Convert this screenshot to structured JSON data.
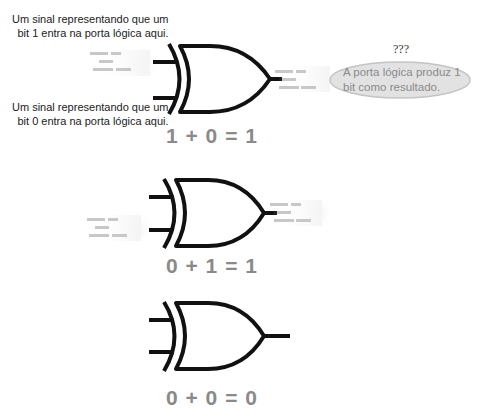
{
  "diagram": {
    "labels": {
      "input_bit1": [
        "Um sinal representando que um",
        "bit 1 entra na porta lógica aqui."
      ],
      "input_bit0": [
        "Um sinal representando que um",
        "bit 0 entra na porta lógica aqui."
      ]
    },
    "output_bubble": {
      "question": "???",
      "text": [
        "A porta lógica produz 1",
        "bit como resultado."
      ]
    },
    "gates": [
      {
        "type": "XOR",
        "inputs": [
          1,
          0
        ],
        "output": 1,
        "equation": "1 + 0 = 1"
      },
      {
        "type": "XOR",
        "inputs": [
          0,
          1
        ],
        "output": 1,
        "equation": "0 + 1 = 1"
      },
      {
        "type": "XOR",
        "inputs": [
          0,
          0
        ],
        "output": 0,
        "equation": "0 + 0 = 0"
      }
    ],
    "colors": {
      "gate_stroke": "#111111",
      "equation": "#8a8a8a",
      "signal": "#c8c8c8",
      "bubble_fill": "#e2e2e2",
      "bubble_stroke": "#c4c4c4"
    }
  }
}
